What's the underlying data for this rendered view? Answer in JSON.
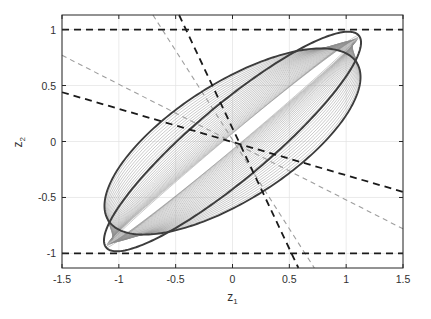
{
  "figure": {
    "background": "#ffffff",
    "axes_color": "#262626",
    "grid_color": "#e2e2e2",
    "width": 431,
    "height": 319
  },
  "axes": {
    "x_label": "z",
    "x_label_sub": "1",
    "y_label": "z",
    "y_label_sub": "2",
    "x_ticks": [
      "-1.5",
      "-1",
      "-0.5",
      "0",
      "0.5",
      "1",
      "1.5"
    ],
    "x_tick_values": [
      -1.5,
      -1,
      -0.5,
      0,
      0.5,
      1,
      1.5
    ],
    "y_ticks": [
      "1",
      "0.5",
      "0",
      "-0.5",
      "-1"
    ],
    "y_tick_values": [
      1,
      0.5,
      0,
      -0.5,
      -1
    ],
    "xlim": [
      -1.5,
      1.5
    ],
    "ylim": [
      -1.13,
      1.13
    ],
    "grid": true
  },
  "chart_data": {
    "type": "line",
    "title": "",
    "xlabel": "z_1",
    "ylabel": "z_2",
    "xlim": [
      -1.5,
      1.5
    ],
    "ylim": [
      -1.13,
      1.13
    ],
    "grid": true,
    "legend": "none",
    "series": [
      {
        "name": "outer-invariant-ellipse",
        "kind": "ellipse",
        "color": "#3d3d3d",
        "linewidth": 2.0,
        "linestyle": "solid",
        "center": [
          0,
          0
        ],
        "semi_major": 1.46,
        "semi_minor": 0.33,
        "rotation_deg": 40.5
      },
      {
        "name": "inner-invariant-ellipse",
        "kind": "ellipse",
        "color": "#3d3d3d",
        "linewidth": 1.9,
        "linestyle": "solid",
        "center": [
          0,
          0
        ],
        "semi_major": 1.3,
        "semi_minor": 0.52,
        "rotation_deg": 33.0
      }
    ],
    "trajectories": {
      "name": "state-trajectories",
      "count": 34,
      "color": "#8c8c8c",
      "linewidth": 0.55,
      "linestyle": "solid",
      "note": "Thin grey closed curves interpolating between the inner and outer ellipse, rotating progressively in angle and aspect ratio."
    },
    "constraint_lines": [
      {
        "name": "upper-bound",
        "label": "z2 = 1",
        "color": "#1a1a1a",
        "linestyle": "dashed",
        "linewidth": 1.8,
        "type": "horizontal",
        "y": 1.0
      },
      {
        "name": "lower-bound",
        "label": "z2 = -1",
        "color": "#1a1a1a",
        "linestyle": "dashed",
        "linewidth": 1.8,
        "type": "horizontal",
        "y": -1.0
      },
      {
        "name": "shallow-diagonal-bound",
        "color": "#1a1a1a",
        "linestyle": "dashed",
        "linewidth": 1.8,
        "type": "line",
        "p1": [
          -1.5,
          0.44
        ],
        "p2": [
          1.5,
          -0.45
        ]
      },
      {
        "name": "steep-diagonal-bound",
        "color": "#1a1a1a",
        "linestyle": "dashed",
        "linewidth": 1.8,
        "type": "line",
        "p1": [
          -0.47,
          1.13
        ],
        "p2": [
          0.58,
          -1.13
        ]
      },
      {
        "name": "shallow-diagonal-light",
        "color": "#9e9e9e",
        "linestyle": "dashed",
        "linewidth": 1.1,
        "type": "line",
        "p1": [
          -1.5,
          0.77
        ],
        "p2": [
          1.5,
          -0.78
        ]
      },
      {
        "name": "steep-diagonal-light",
        "color": "#9e9e9e",
        "linestyle": "dashed",
        "linewidth": 1.1,
        "type": "line",
        "p1": [
          -0.7,
          1.13
        ],
        "p2": [
          0.72,
          -1.13
        ]
      }
    ]
  }
}
